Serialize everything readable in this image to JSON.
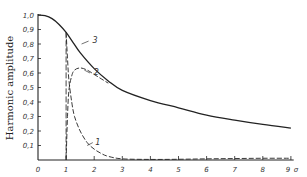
{
  "chart_data": {
    "type": "line",
    "title": "",
    "xlabel": "σ",
    "ylabel": "Harmonic amplitude",
    "xlim": [
      0,
      9
    ],
    "ylim": [
      0,
      1.0
    ],
    "grid": false,
    "legend": "inline curve labels",
    "x_ticks": [
      "0",
      "1",
      "2",
      "3",
      "4",
      "5",
      "6",
      "7",
      "8",
      "9"
    ],
    "y_ticks": [
      "0,1",
      "0,2",
      "0,3",
      "0,4",
      "0,5",
      "0,6",
      "0,7",
      "0,8",
      "0,9",
      "1,0"
    ],
    "series": [
      {
        "name": "1",
        "style": "dashed",
        "x": [
          1.0,
          1.05,
          1.1,
          1.2,
          1.3,
          1.5,
          1.75,
          2.0,
          2.25,
          2.5,
          3.0,
          4.0,
          5.0,
          6.0,
          7.0,
          8.0,
          9.0
        ],
        "y": [
          0.88,
          0.7,
          0.55,
          0.4,
          0.3,
          0.2,
          0.12,
          0.075,
          0.045,
          0.025,
          0.008,
          0.004,
          0.005,
          0.008,
          0.01,
          0.012,
          0.012
        ]
      },
      {
        "name": "2",
        "style": "dashed",
        "x": [
          1.0,
          1.05,
          1.1,
          1.2,
          1.3,
          1.5,
          1.75,
          2.0,
          2.25,
          2.5
        ],
        "y": [
          0.0,
          0.3,
          0.48,
          0.58,
          0.62,
          0.635,
          0.62,
          0.59,
          0.56,
          0.53
        ]
      },
      {
        "name": "3",
        "style": "solid",
        "x": [
          0,
          0.25,
          0.5,
          0.75,
          1.0,
          1.25,
          1.5,
          2.0,
          2.5,
          3.0,
          4.0,
          5.0,
          6.0,
          7.0,
          8.0,
          9.0
        ],
        "y": [
          1.0,
          0.995,
          0.975,
          0.935,
          0.88,
          0.81,
          0.74,
          0.63,
          0.545,
          0.48,
          0.41,
          0.36,
          0.31,
          0.275,
          0.245,
          0.22
        ]
      }
    ],
    "annotations": [
      {
        "text": "1",
        "x": 2.0,
        "y": 0.12
      },
      {
        "text": "2",
        "x": 1.95,
        "y": 0.6
      },
      {
        "text": "3",
        "x": 1.9,
        "y": 0.82
      }
    ]
  }
}
